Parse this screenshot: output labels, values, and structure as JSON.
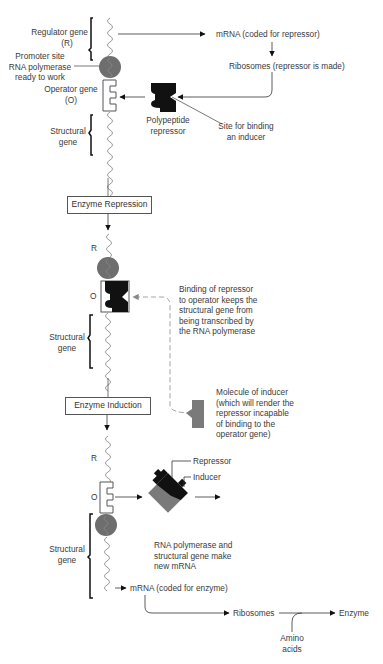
{
  "section1": {
    "regulator_gene": "Regulator gene",
    "regulator_gene_abbr": "(R)",
    "promoter_site": "Promoter site",
    "rna_polymerase": "RNA polymerase",
    "ready_to_work": "ready to work",
    "operator_gene": "Operator gene",
    "operator_gene_abbr": "(O)",
    "structural_gene_1": "Structural",
    "structural_gene_2": "gene",
    "mrna_repressor": "mRNA (coded for repressor)",
    "ribosomes_repressor": "Ribosomes (repressor is made)",
    "polypeptide_1": "Polypeptide",
    "polypeptide_2": "repressor",
    "site_binding_1": "Site for binding",
    "site_binding_2": "an inducer"
  },
  "repression_box": "Enzyme Repression",
  "section2": {
    "r_label": "R",
    "o_label": "O",
    "structural_gene_1": "Structural",
    "structural_gene_2": "gene",
    "binding_note": [
      "Binding of repressor",
      "to operator keeps the",
      "structural gene from",
      "being transcribed by",
      "the RNA polymerase"
    ],
    "inducer_note": [
      "Molecule of inducer",
      "(which will render the",
      "repressor incapable",
      "of binding to the",
      "operator gene)"
    ]
  },
  "induction_box": "Enzyme Induction",
  "section3": {
    "r_label": "R",
    "o_label": "O",
    "repressor": "Repressor",
    "inducer": "Inducer",
    "structural_gene_1": "Structural",
    "structural_gene_2": "gene",
    "rna_note": [
      "RNA polymerase and",
      "structural gene make",
      "new mRNA"
    ],
    "mrna_enzyme": "mRNA (coded for enzyme)",
    "ribosomes": "Ribosomes",
    "enzyme": "Enzyme",
    "amino_1": "Amino",
    "amino_2": "acids"
  },
  "colors": {
    "polymerase": "#6e6e6e",
    "repressor": "#111111",
    "inducer": "#7a7a7a",
    "line": "#444444",
    "dashed": "#999999"
  }
}
